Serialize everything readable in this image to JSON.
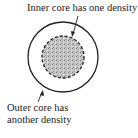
{
  "labels": {
    "inner": "Inner core has one density",
    "outer_line1": "Outer core has",
    "outer_line2": "another density"
  },
  "colors": {
    "stroke": "#222222",
    "fill": "#b8b8b8"
  }
}
